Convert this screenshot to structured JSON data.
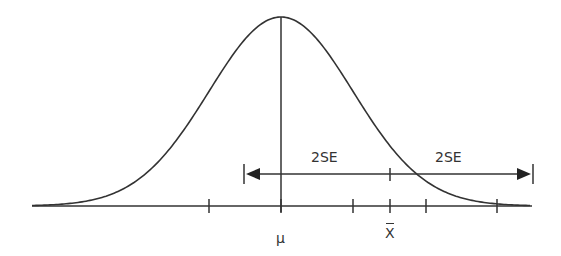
{
  "diagram": {
    "type": "normal-distribution-confidence-interval",
    "curve": {
      "peak_x": 281,
      "peak_y": 17,
      "baseline_y": 206,
      "sd_px": 72,
      "x_start": 32,
      "x_end": 530
    },
    "axis": {
      "ticks_x": [
        209,
        281,
        353,
        390,
        426,
        497
      ]
    },
    "interval": {
      "left_x": 244,
      "center_x": 390,
      "right_x": 533,
      "y": 174
    },
    "labels": {
      "mu": "μ",
      "xbar": "X",
      "left_span": "2SE",
      "right_span": "2SE"
    },
    "colors": {
      "stroke": "#333333",
      "background": "#ffffff"
    }
  }
}
